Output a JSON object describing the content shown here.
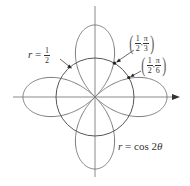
{
  "diagram": {
    "type": "polar-graph",
    "curves": [
      {
        "name": "rose",
        "equation": "r = cos 2θ",
        "color": "#7a7a7a"
      },
      {
        "name": "circle",
        "equation": "r = 1/2",
        "color": "#555555"
      }
    ],
    "axes": {
      "color": "#8a8a8a",
      "arrow": "positive-x"
    }
  },
  "labels": {
    "circle": {
      "var": "r",
      "eq": "=",
      "num": "1",
      "den": "2"
    },
    "rose": {
      "var": "r",
      "eq": "=",
      "fn": "cos 2",
      "theta": "θ"
    },
    "point1": {
      "r_num": "1",
      "r_den": "2",
      "t_num": "π",
      "t_den": "3",
      "open": "(",
      "close": ")",
      "sep": ","
    },
    "point2": {
      "r_num": "1",
      "r_den": "2",
      "t_num": "π",
      "t_den": "6",
      "open": "(",
      "close": ")",
      "sep": ","
    }
  }
}
